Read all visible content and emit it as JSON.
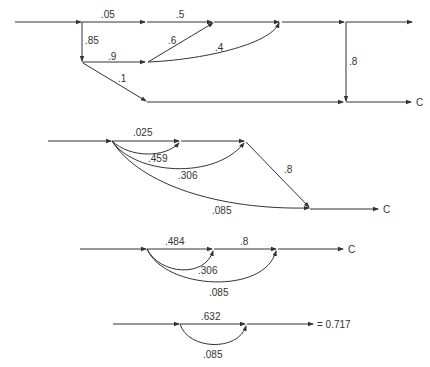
{
  "diagrams": [
    {
      "id": "original-network",
      "labels": {
        "e1": ".05",
        "e2": ".5",
        "e3": ".85",
        "e4": ".9",
        "e5": ".6",
        "e6": ".4",
        "e7": ".1",
        "e8": ".8",
        "end": "C"
      }
    },
    {
      "id": "reduced-network-1",
      "labels": {
        "e1": ".025",
        "e2": ".459",
        "e3": ".306",
        "e4": ".085",
        "e5": ".8",
        "end": "C"
      }
    },
    {
      "id": "reduced-network-2",
      "labels": {
        "e1": ".484",
        "e2": ".8",
        "e3": ".306",
        "e4": ".085",
        "end": "C"
      }
    },
    {
      "id": "reduced-network-3",
      "labels": {
        "e1": ".632",
        "e2": ".085",
        "result": "= 0.717"
      }
    }
  ],
  "colors": {
    "line": "#333333",
    "background": "#ffffff"
  }
}
